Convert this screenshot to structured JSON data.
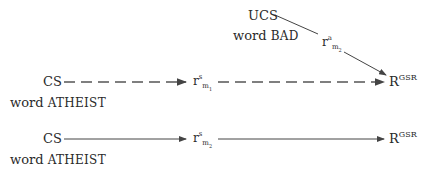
{
  "diagram": {
    "top": {
      "stimulus": "UCS",
      "word_prefix": "word",
      "word": "BAD",
      "mediator": {
        "base": "r",
        "sup": "a",
        "sub": "m",
        "subsub": "2"
      }
    },
    "row1": {
      "stimulus": "CS",
      "word_prefix": "word",
      "word": "ATHEIST",
      "mediator": {
        "base": "r",
        "sup": "s",
        "sub": "m",
        "subsub": "1"
      },
      "response": {
        "base": "R",
        "sup": "GSR"
      },
      "arrow_style": "dashed"
    },
    "row2": {
      "stimulus": "CS",
      "word_prefix": "word",
      "word": "ATHEIST",
      "mediator": {
        "base": "r",
        "sup": "s",
        "sub": "m",
        "subsub": "2"
      },
      "response": {
        "base": "R",
        "sup": "GSR"
      },
      "arrow_style": "solid"
    },
    "colors": {
      "line": "#444444",
      "text": "#2a2a2a"
    }
  }
}
